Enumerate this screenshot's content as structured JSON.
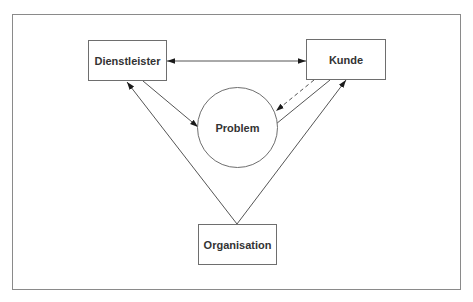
{
  "diagram": {
    "nodes": {
      "dienstleister": {
        "label": "Dienstleister",
        "shape": "rectangle"
      },
      "kunde": {
        "label": "Kunde",
        "shape": "rectangle"
      },
      "problem": {
        "label": "Problem",
        "shape": "circle"
      },
      "organisation": {
        "label": "Organisation",
        "shape": "rectangle"
      }
    },
    "edges": [
      {
        "from": "dienstleister",
        "to": "kunde",
        "style": "solid",
        "arrows": "both"
      },
      {
        "from": "dienstleister",
        "to": "problem",
        "style": "solid",
        "arrows": "end"
      },
      {
        "from": "kunde",
        "to": "problem",
        "style": "dashed",
        "arrows": "end"
      },
      {
        "from": "kunde",
        "to": "problem",
        "style": "solid",
        "arrows": "none"
      },
      {
        "from": "organisation",
        "to": "dienstleister",
        "style": "solid",
        "arrows": "end"
      },
      {
        "from": "organisation",
        "to": "kunde",
        "style": "solid",
        "arrows": "end"
      }
    ],
    "colors": {
      "line": "#555555",
      "border": "#6e6e6e",
      "text": "#333333",
      "frame": "#8a8a8a"
    }
  }
}
